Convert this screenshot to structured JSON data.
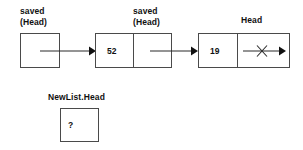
{
  "diagram": {
    "background_color": "#ffffff",
    "line_color": "#4a4a4a",
    "text_color": "#111111",
    "nodes": [
      {
        "id": "node-saved-head-empty",
        "label": "saved\n(Head)",
        "label_line1": "saved",
        "label_line2": "(Head)",
        "data_value": "",
        "cells": 1,
        "has_outgoing_arrow": true
      },
      {
        "id": "node-52",
        "label": "saved\n(Head)",
        "label_line1": "saved",
        "label_line2": "(Head)",
        "data_value": "52",
        "cells": 2,
        "has_outgoing_arrow": true
      },
      {
        "id": "node-19",
        "label": "Head",
        "label_line1": "Head",
        "label_line2": "",
        "data_value": "19",
        "cells": 2,
        "has_outgoing_arrow": true,
        "pointer_crossed_out": true
      }
    ],
    "newlist": {
      "label": "NewList.Head",
      "value": "?"
    }
  }
}
